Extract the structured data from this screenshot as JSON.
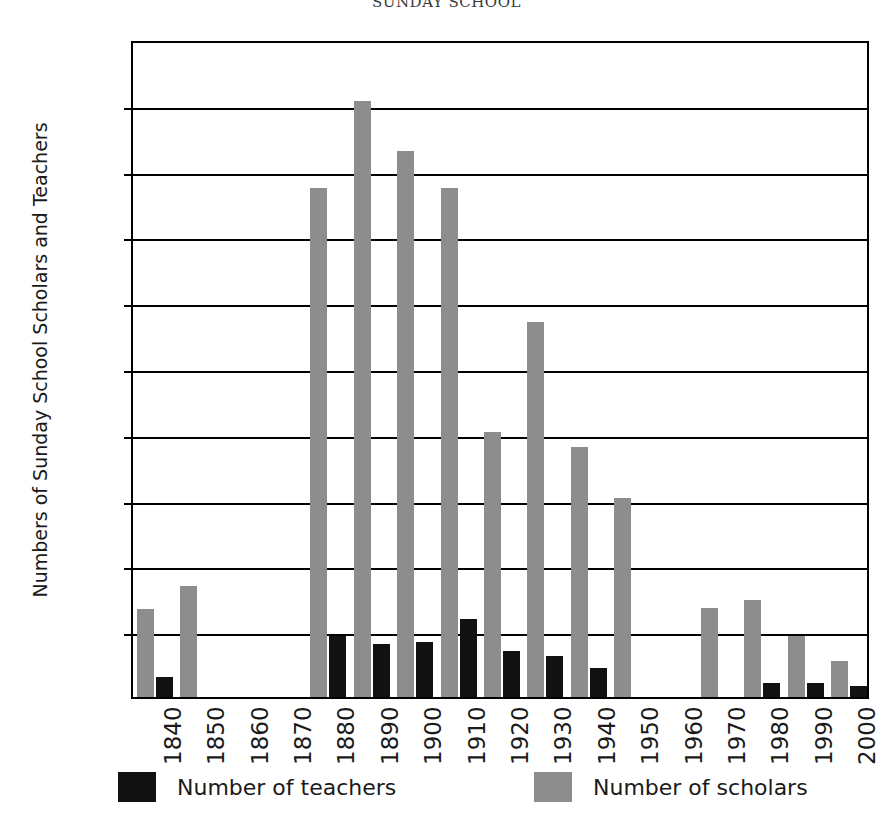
{
  "chart_data": {
    "type": "bar",
    "title": "SUNDAY SCHOOL",
    "xlabel": "",
    "ylabel": "Numbers of Sunday School Scholars and Teachers",
    "ylim": [
      0,
      500
    ],
    "ytick_step": 50,
    "yticks": [
      0,
      50,
      100,
      150,
      200,
      250,
      300,
      350,
      400,
      450,
      500
    ],
    "grid": true,
    "legend_position": "bottom",
    "categories": [
      "1840",
      "1850",
      "1860",
      "1870",
      "1880",
      "1890",
      "1900",
      "1910",
      "1920",
      "1930",
      "1940",
      "1950",
      "1960",
      "1970",
      "1980",
      "1990",
      "2000"
    ],
    "series": [
      {
        "name": "Number of teachers",
        "color": "#111111",
        "values": [
          15,
          0,
          0,
          0,
          46,
          40,
          42,
          59,
          35,
          31,
          22,
          0,
          0,
          0,
          11,
          11,
          8
        ]
      },
      {
        "name": "Number of scholars",
        "color": "#8d8d8d",
        "values": [
          67,
          84,
          0,
          0,
          387,
          453,
          415,
          387,
          201,
          285,
          190,
          151,
          0,
          68,
          74,
          46,
          27
        ]
      }
    ]
  },
  "legend": {
    "items": [
      {
        "label": "Number of teachers",
        "swatch": "teachers"
      },
      {
        "label": "Number of scholars",
        "swatch": "scholars"
      }
    ]
  }
}
